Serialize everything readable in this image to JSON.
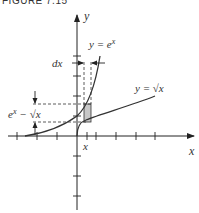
{
  "figure": {
    "caption": "FIGURE 7.15"
  },
  "axes": {
    "x_label": "x",
    "y_label": "y"
  },
  "curves": [
    {
      "name": "exp",
      "label": "y = e",
      "sup": "x"
    },
    {
      "name": "sqrt",
      "label": "y = √x"
    }
  ],
  "annotations": {
    "dx_label": "dx",
    "height_label_e": "e",
    "height_label_sup": "x",
    "height_label_rest": "− √x",
    "x_marker": "x"
  },
  "colors": {
    "axis": "#222222",
    "curve": "#333333",
    "shade": "#c8c8c8",
    "text": "#333333"
  }
}
